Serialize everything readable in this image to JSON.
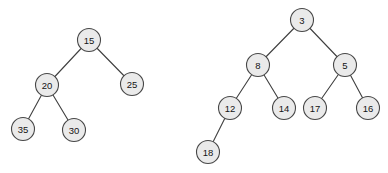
{
  "diagram": {
    "canvas": {
      "width": 388,
      "height": 173
    },
    "style": {
      "background": "#ffffff",
      "node_fill": "#eaeaea",
      "node_border": "#474747",
      "edge_color": "#3f3f3f",
      "text_color": "#141414",
      "node_radius": 11.5
    },
    "trees": [
      {
        "name": "left-tree",
        "root": "15",
        "nodes": [
          {
            "id": "15",
            "label": "15",
            "x": 89,
            "y": 40
          },
          {
            "id": "20",
            "label": "20",
            "x": 47,
            "y": 85
          },
          {
            "id": "25",
            "label": "25",
            "x": 132,
            "y": 84
          },
          {
            "id": "35",
            "label": "35",
            "x": 23,
            "y": 129
          },
          {
            "id": "30",
            "label": "30",
            "x": 74,
            "y": 130
          }
        ],
        "edges": [
          {
            "from": "15",
            "to": "20"
          },
          {
            "from": "15",
            "to": "25"
          },
          {
            "from": "20",
            "to": "35"
          },
          {
            "from": "20",
            "to": "30"
          }
        ]
      },
      {
        "name": "right-tree",
        "root": "3",
        "nodes": [
          {
            "id": "3",
            "label": "3",
            "x": 302,
            "y": 20
          },
          {
            "id": "8",
            "label": "8",
            "x": 258,
            "y": 65
          },
          {
            "id": "5",
            "label": "5",
            "x": 345,
            "y": 65
          },
          {
            "id": "12",
            "label": "12",
            "x": 230,
            "y": 108
          },
          {
            "id": "14",
            "label": "14",
            "x": 284,
            "y": 108
          },
          {
            "id": "17",
            "label": "17",
            "x": 315,
            "y": 108
          },
          {
            "id": "16",
            "label": "16",
            "x": 368,
            "y": 108
          },
          {
            "id": "18",
            "label": "18",
            "x": 208,
            "y": 152
          }
        ],
        "edges": [
          {
            "from": "3",
            "to": "8"
          },
          {
            "from": "3",
            "to": "5"
          },
          {
            "from": "8",
            "to": "12"
          },
          {
            "from": "8",
            "to": "14"
          },
          {
            "from": "5",
            "to": "17"
          },
          {
            "from": "5",
            "to": "16"
          },
          {
            "from": "12",
            "to": "18"
          }
        ]
      }
    ]
  }
}
